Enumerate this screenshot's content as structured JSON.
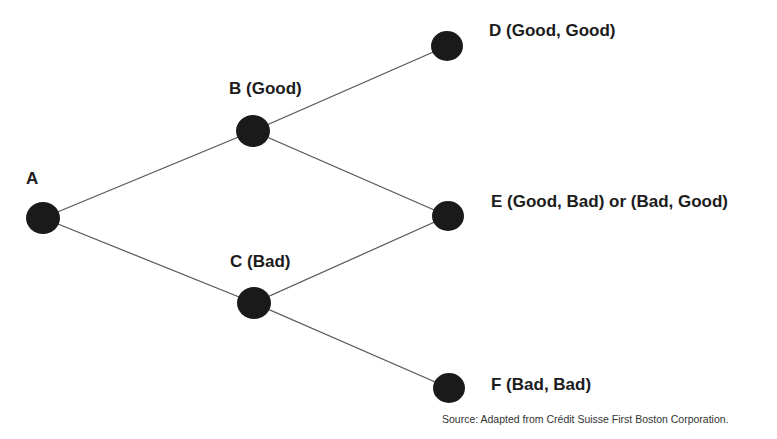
{
  "diagram": {
    "type": "binomial-tree",
    "nodes": [
      {
        "id": "A",
        "label": "A",
        "x": 43,
        "y": 218
      },
      {
        "id": "B",
        "label": "B (Good)",
        "x": 253,
        "y": 131
      },
      {
        "id": "C",
        "label": "C (Bad)",
        "x": 254,
        "y": 303
      },
      {
        "id": "D",
        "label": "D (Good, Good)",
        "x": 447,
        "y": 46
      },
      {
        "id": "E",
        "label": "E (Good, Bad) or (Bad, Good)",
        "x": 448,
        "y": 216
      },
      {
        "id": "F",
        "label": "F (Bad, Bad)",
        "x": 449,
        "y": 388
      }
    ],
    "edges": [
      [
        "A",
        "B"
      ],
      [
        "A",
        "C"
      ],
      [
        "B",
        "D"
      ],
      [
        "B",
        "E"
      ],
      [
        "C",
        "E"
      ],
      [
        "C",
        "F"
      ]
    ],
    "source": "Source:  Adapted from Crédit Suisse First Boston Corporation.",
    "colors": {
      "node": "#1a1a1a",
      "edge": "#555555",
      "text": "#1c1c1c"
    }
  }
}
